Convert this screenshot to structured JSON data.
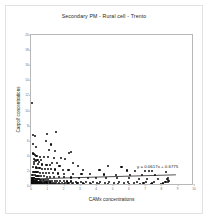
{
  "chart_data": {
    "type": "scatter",
    "title": "Secondary PM -  Rural cell - Trento",
    "xlabel": "CAMx concentrations",
    "ylabel": "Carpolf concentrations",
    "annotation": "y = 0.0617x + 0.6775",
    "trendline": {
      "slope": 0.0617,
      "intercept": 0.6775,
      "x_start": 0,
      "x_end": 9
    },
    "xlim": [
      0,
      10
    ],
    "ylim": [
      0,
      20
    ],
    "xticks": [
      0,
      1,
      2,
      3,
      4,
      5,
      6,
      7,
      8,
      9,
      10
    ],
    "xtick_labels": [
      "0",
      "1",
      "2",
      "3",
      "4",
      "5",
      "6",
      "7",
      "8",
      "9",
      "10"
    ],
    "yticks": [
      0,
      2,
      4,
      6,
      8,
      10,
      12,
      14,
      16,
      18,
      20
    ],
    "ytick_labels": [
      "0",
      "2",
      "4",
      "6",
      "8",
      "10",
      "12",
      "14",
      "16",
      "18",
      "20"
    ],
    "grid": false,
    "legend": null,
    "marker_color": "#0d0d0d",
    "line_color": "#3a3a3a",
    "frame_color": "#b8b8b8",
    "points": [
      [
        0.08,
        11.0
      ],
      [
        0.1,
        6.7
      ],
      [
        0.22,
        6.6
      ],
      [
        1.0,
        6.9
      ],
      [
        1.55,
        7.1
      ],
      [
        0.12,
        5.6
      ],
      [
        0.9,
        5.9
      ],
      [
        1.2,
        5.5
      ],
      [
        0.3,
        5.2
      ],
      [
        1.1,
        4.8
      ],
      [
        1.45,
        4.6
      ],
      [
        2.35,
        4.4
      ],
      [
        2.45,
        4.5
      ],
      [
        0.14,
        4.3
      ],
      [
        0.2,
        4.2
      ],
      [
        0.26,
        4.1
      ],
      [
        0.34,
        4.0
      ],
      [
        0.55,
        3.9
      ],
      [
        0.8,
        3.85
      ],
      [
        1.05,
        3.8
      ],
      [
        1.4,
        3.75
      ],
      [
        1.85,
        3.7
      ],
      [
        2.1,
        3.6
      ],
      [
        0.16,
        3.55
      ],
      [
        0.24,
        3.5
      ],
      [
        0.4,
        3.45
      ],
      [
        0.62,
        3.4
      ],
      [
        0.3,
        3.3
      ],
      [
        0.18,
        3.2
      ],
      [
        0.5,
        3.15
      ],
      [
        1.3,
        3.1
      ],
      [
        1.6,
        3.05
      ],
      [
        2.6,
        3.0
      ],
      [
        0.2,
        2.95
      ],
      [
        0.44,
        2.9
      ],
      [
        0.7,
        2.85
      ],
      [
        0.95,
        2.8
      ],
      [
        1.15,
        2.75
      ],
      [
        1.75,
        2.7
      ],
      [
        2.9,
        2.65
      ],
      [
        4.7,
        2.6
      ],
      [
        5.55,
        2.55
      ],
      [
        0.12,
        2.5
      ],
      [
        0.28,
        2.45
      ],
      [
        0.36,
        2.4
      ],
      [
        0.52,
        2.35
      ],
      [
        0.66,
        2.3
      ],
      [
        0.86,
        2.28
      ],
      [
        1.02,
        2.25
      ],
      [
        1.25,
        2.2
      ],
      [
        1.5,
        2.18
      ],
      [
        1.95,
        2.15
      ],
      [
        2.3,
        2.12
      ],
      [
        3.2,
        2.1
      ],
      [
        4.2,
        2.08
      ],
      [
        5.9,
        2.05
      ],
      [
        6.4,
        2.0
      ],
      [
        7.0,
        2.0
      ],
      [
        7.25,
        1.98
      ],
      [
        7.4,
        1.95
      ],
      [
        8.3,
        1.9
      ],
      [
        0.1,
        1.9
      ],
      [
        0.18,
        1.88
      ],
      [
        0.26,
        1.85
      ],
      [
        0.34,
        1.82
      ],
      [
        0.42,
        1.8
      ],
      [
        0.58,
        1.78
      ],
      [
        0.74,
        1.75
      ],
      [
        0.92,
        1.72
      ],
      [
        1.12,
        1.7
      ],
      [
        1.35,
        1.68
      ],
      [
        1.65,
        1.65
      ],
      [
        2.0,
        1.62
      ],
      [
        2.55,
        1.6
      ],
      [
        3.1,
        1.58
      ],
      [
        3.6,
        1.55
      ],
      [
        4.5,
        1.52
      ],
      [
        5.2,
        1.5
      ],
      [
        6.1,
        1.48
      ],
      [
        6.8,
        1.45
      ],
      [
        7.6,
        1.42
      ],
      [
        0.06,
        1.45
      ],
      [
        0.14,
        1.42
      ],
      [
        0.22,
        1.4
      ],
      [
        0.3,
        1.38
      ],
      [
        0.4,
        1.35
      ],
      [
        0.5,
        1.33
      ],
      [
        0.64,
        1.3
      ],
      [
        0.78,
        1.28
      ],
      [
        0.96,
        1.25
      ],
      [
        1.18,
        1.22
      ],
      [
        1.42,
        1.2
      ],
      [
        1.72,
        1.18
      ],
      [
        2.05,
        1.15
      ],
      [
        2.45,
        1.12
      ],
      [
        2.95,
        1.1
      ],
      [
        3.5,
        1.08
      ],
      [
        4.0,
        1.05
      ],
      [
        4.6,
        1.02
      ],
      [
        5.3,
        1.0
      ],
      [
        6.0,
        1.0
      ],
      [
        6.6,
        0.98
      ],
      [
        7.1,
        0.95
      ],
      [
        7.8,
        0.92
      ],
      [
        8.35,
        0.9
      ],
      [
        0.04,
        1.1
      ],
      [
        0.08,
        1.08
      ],
      [
        0.12,
        1.05
      ],
      [
        0.16,
        1.02
      ],
      [
        0.2,
        1.0
      ],
      [
        0.25,
        0.98
      ],
      [
        0.3,
        0.95
      ],
      [
        0.36,
        0.92
      ],
      [
        0.42,
        0.9
      ],
      [
        0.48,
        0.88
      ],
      [
        0.56,
        0.85
      ],
      [
        0.64,
        0.83
      ],
      [
        0.72,
        0.8
      ],
      [
        0.82,
        0.78
      ],
      [
        0.92,
        0.76
      ],
      [
        1.04,
        0.74
      ],
      [
        1.16,
        0.72
      ],
      [
        1.3,
        0.7
      ],
      [
        1.46,
        0.68
      ],
      [
        1.62,
        0.66
      ],
      [
        1.8,
        0.64
      ],
      [
        2.0,
        0.62
      ],
      [
        2.22,
        0.6
      ],
      [
        2.48,
        0.6
      ],
      [
        2.75,
        0.58
      ],
      [
        3.05,
        0.57
      ],
      [
        3.4,
        0.56
      ],
      [
        3.8,
        0.55
      ],
      [
        4.25,
        0.54
      ],
      [
        4.8,
        0.53
      ],
      [
        5.4,
        0.52
      ],
      [
        5.95,
        0.51
      ],
      [
        6.5,
        0.5
      ],
      [
        7.05,
        0.5
      ],
      [
        7.55,
        0.49
      ],
      [
        8.25,
        0.48
      ],
      [
        8.4,
        0.55
      ],
      [
        8.45,
        0.7
      ],
      [
        8.42,
        0.85
      ],
      [
        8.38,
        1.0
      ],
      [
        0.03,
        0.8
      ],
      [
        0.06,
        0.78
      ],
      [
        0.09,
        0.76
      ],
      [
        0.12,
        0.74
      ],
      [
        0.15,
        0.72
      ],
      [
        0.18,
        0.7
      ],
      [
        0.21,
        0.68
      ],
      [
        0.25,
        0.66
      ],
      [
        0.29,
        0.64
      ],
      [
        0.33,
        0.62
      ],
      [
        0.38,
        0.6
      ],
      [
        0.43,
        0.58
      ],
      [
        0.49,
        0.56
      ],
      [
        0.55,
        0.55
      ],
      [
        0.62,
        0.53
      ],
      [
        0.69,
        0.52
      ],
      [
        0.77,
        0.5
      ],
      [
        0.86,
        0.49
      ],
      [
        0.95,
        0.48
      ],
      [
        1.05,
        0.47
      ],
      [
        1.16,
        0.46
      ],
      [
        1.28,
        0.45
      ],
      [
        1.41,
        0.44
      ],
      [
        1.55,
        0.43
      ],
      [
        1.7,
        0.42
      ],
      [
        1.88,
        0.41
      ],
      [
        2.08,
        0.4
      ],
      [
        2.3,
        0.4
      ],
      [
        2.55,
        0.39
      ],
      [
        2.85,
        0.38
      ],
      [
        3.2,
        0.38
      ],
      [
        3.6,
        0.37
      ],
      [
        4.05,
        0.36
      ],
      [
        4.55,
        0.36
      ],
      [
        5.1,
        0.35
      ],
      [
        5.7,
        0.35
      ],
      [
        6.3,
        0.34
      ],
      [
        6.9,
        0.34
      ],
      [
        7.45,
        0.33
      ],
      [
        8.1,
        0.33
      ],
      [
        0.02,
        0.55
      ],
      [
        0.04,
        0.53
      ],
      [
        0.06,
        0.52
      ],
      [
        0.08,
        0.5
      ],
      [
        0.1,
        0.49
      ],
      [
        0.13,
        0.48
      ],
      [
        0.16,
        0.46
      ],
      [
        0.19,
        0.45
      ],
      [
        0.22,
        0.44
      ],
      [
        0.26,
        0.43
      ],
      [
        0.3,
        0.42
      ],
      [
        0.34,
        0.41
      ],
      [
        0.39,
        0.4
      ],
      [
        0.44,
        0.39
      ],
      [
        0.5,
        0.38
      ],
      [
        0.56,
        0.37
      ],
      [
        0.63,
        0.36
      ],
      [
        0.7,
        0.35
      ],
      [
        0.78,
        0.35
      ],
      [
        0.87,
        0.34
      ],
      [
        0.97,
        0.33
      ],
      [
        1.08,
        0.32
      ],
      [
        1.2,
        0.32
      ],
      [
        1.33,
        0.31
      ],
      [
        1.47,
        0.3
      ],
      [
        1.63,
        0.3
      ],
      [
        1.8,
        0.29
      ],
      [
        2.0,
        0.29
      ],
      [
        2.24,
        0.28
      ],
      [
        2.52,
        0.28
      ],
      [
        2.84,
        0.27
      ],
      [
        3.22,
        0.27
      ],
      [
        3.66,
        0.26
      ],
      [
        4.16,
        0.26
      ],
      [
        4.74,
        0.25
      ],
      [
        5.36,
        0.25
      ],
      [
        6.02,
        0.24
      ],
      [
        6.7,
        0.24
      ],
      [
        7.35,
        0.23
      ],
      [
        8.0,
        0.23
      ],
      [
        0.02,
        0.32
      ],
      [
        0.05,
        0.31
      ],
      [
        0.07,
        0.3
      ],
      [
        0.1,
        0.29
      ],
      [
        0.13,
        0.28
      ],
      [
        0.16,
        0.27
      ],
      [
        0.2,
        0.26
      ],
      [
        0.24,
        0.26
      ],
      [
        0.28,
        0.25
      ],
      [
        0.33,
        0.24
      ],
      [
        0.38,
        0.24
      ],
      [
        0.44,
        0.23
      ],
      [
        0.51,
        0.22
      ],
      [
        0.58,
        0.22
      ],
      [
        0.66,
        0.21
      ],
      [
        0.75,
        0.21
      ],
      [
        0.85,
        0.2
      ],
      [
        0.96,
        0.2
      ],
      [
        1.08,
        0.19
      ],
      [
        1.22,
        0.19
      ],
      [
        1.38,
        0.18
      ],
      [
        1.56,
        0.18
      ],
      [
        1.76,
        0.17
      ],
      [
        1.98,
        0.17
      ],
      [
        2.24,
        0.16
      ],
      [
        2.54,
        0.16
      ],
      [
        2.9,
        0.15
      ],
      [
        3.32,
        0.15
      ],
      [
        3.8,
        0.15
      ],
      [
        4.36,
        0.14
      ],
      [
        5.0,
        0.14
      ],
      [
        5.7,
        0.14
      ],
      [
        6.45,
        0.13
      ],
      [
        7.2,
        0.13
      ],
      [
        7.95,
        0.13
      ],
      [
        8.3,
        0.12
      ],
      [
        0.01,
        0.18
      ],
      [
        0.03,
        0.17
      ],
      [
        0.05,
        0.17
      ],
      [
        0.08,
        0.16
      ],
      [
        0.11,
        0.16
      ],
      [
        0.14,
        0.15
      ],
      [
        0.17,
        0.15
      ],
      [
        0.21,
        0.14
      ],
      [
        0.25,
        0.14
      ],
      [
        0.29,
        0.13
      ],
      [
        0.34,
        0.13
      ],
      [
        0.4,
        0.12
      ],
      [
        0.46,
        0.12
      ],
      [
        0.53,
        0.12
      ],
      [
        0.61,
        0.11
      ],
      [
        0.7,
        0.11
      ],
      [
        0.8,
        0.11
      ],
      [
        0.91,
        0.1
      ],
      [
        1.03,
        0.1
      ],
      [
        1.17,
        0.1
      ],
      [
        1.33,
        0.09
      ],
      [
        1.51,
        0.09
      ],
      [
        1.71,
        0.09
      ],
      [
        1.94,
        0.08
      ],
      [
        2.2,
        0.08
      ],
      [
        2.5,
        0.08
      ],
      [
        2.85,
        0.08
      ],
      [
        3.26,
        0.07
      ],
      [
        3.74,
        0.07
      ],
      [
        4.3,
        0.07
      ],
      [
        4.95,
        0.07
      ],
      [
        5.65,
        0.06
      ],
      [
        6.4,
        0.06
      ],
      [
        7.15,
        0.06
      ],
      [
        7.9,
        0.06
      ],
      [
        8.4,
        0.06
      ],
      [
        0.01,
        0.08
      ],
      [
        0.02,
        0.07
      ],
      [
        0.04,
        0.07
      ],
      [
        0.06,
        0.06
      ],
      [
        0.09,
        0.06
      ],
      [
        0.12,
        0.06
      ],
      [
        0.15,
        0.05
      ],
      [
        0.18,
        0.05
      ],
      [
        0.22,
        0.05
      ],
      [
        0.27,
        0.05
      ],
      [
        0.32,
        0.04
      ],
      [
        0.37,
        0.04
      ],
      [
        0.43,
        0.04
      ],
      [
        0.5,
        0.04
      ],
      [
        0.57,
        0.03
      ],
      [
        0.65,
        0.03
      ],
      [
        0.74,
        0.03
      ],
      [
        0.84,
        0.03
      ],
      [
        0.95,
        0.03
      ],
      [
        1.07,
        0.02
      ],
      [
        1.21,
        0.02
      ],
      [
        1.37,
        0.02
      ],
      [
        1.55,
        0.02
      ],
      [
        1.75,
        0.02
      ],
      [
        1.99,
        0.02
      ],
      [
        2.26,
        0.02
      ],
      [
        2.58,
        0.02
      ],
      [
        2.95,
        0.02
      ],
      [
        3.38,
        0.02
      ],
      [
        3.88,
        0.02
      ],
      [
        4.45,
        0.02
      ],
      [
        5.1,
        0.02
      ],
      [
        5.8,
        0.02
      ],
      [
        6.55,
        0.02
      ],
      [
        7.3,
        0.02
      ],
      [
        8.05,
        0.02
      ]
    ]
  }
}
